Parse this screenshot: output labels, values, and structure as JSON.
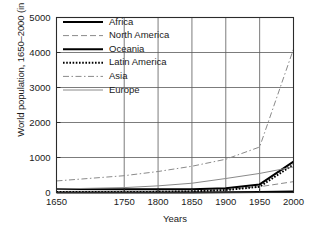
{
  "chart_data": {
    "type": "line",
    "title": "",
    "xlabel": "Years",
    "ylabel": "World population, 1650–2000 (in millions)",
    "xlim": [
      1650,
      2000
    ],
    "ylim": [
      0,
      5000
    ],
    "xticks": [
      1650,
      1750,
      1800,
      1850,
      1900,
      1950,
      2000
    ],
    "xticklabels": [
      "1650",
      "1750",
      "1800",
      "1850",
      "1900",
      "1950",
      "2000"
    ],
    "yticks": [
      0,
      1000,
      2000,
      3000,
      4000,
      5000
    ],
    "yticklabels": [
      "0",
      "1000",
      "2000",
      "3000",
      "4000",
      "5000"
    ],
    "grid": true,
    "legend_position": "upper left",
    "x": [
      1650,
      1750,
      1800,
      1850,
      1900,
      1950,
      2000
    ],
    "series": [
      {
        "name": "Africa",
        "style": "solid",
        "color": "#000000",
        "width": 2.0,
        "values": [
          100,
          95,
          90,
          95,
          120,
          230,
          880
        ]
      },
      {
        "name": "North America",
        "style": "dashed",
        "color": "#8a8a8a",
        "width": 1.0,
        "values": [
          5,
          5,
          10,
          25,
          80,
          165,
          310
        ]
      },
      {
        "name": "Oceania",
        "style": "solid",
        "color": "#000000",
        "width": 2.0,
        "values": [
          2,
          2,
          2,
          2,
          6,
          13,
          30
        ]
      },
      {
        "name": "Latin America",
        "style": "dotted",
        "color": "#000000",
        "width": 2.0,
        "values": [
          12,
          11,
          19,
          33,
          70,
          165,
          800
        ]
      },
      {
        "name": "Asia",
        "style": "dashdot",
        "color": "#8a8a8a",
        "width": 1.0,
        "values": [
          330,
          480,
          600,
          750,
          950,
          1300,
          4100
        ]
      },
      {
        "name": "Europe",
        "style": "solid",
        "color": "#8a8a8a",
        "width": 1.0,
        "values": [
          100,
          140,
          190,
          265,
          400,
          545,
          730
        ]
      }
    ]
  },
  "axes": {
    "ylabel_text": "World population, 1650–2000 (in millions)",
    "xlabel_text": "Years"
  }
}
